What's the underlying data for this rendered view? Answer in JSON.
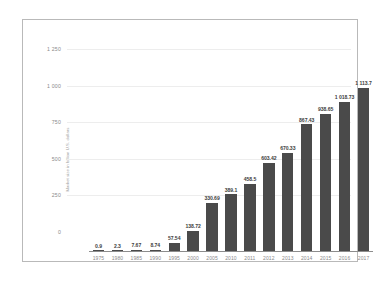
{
  "chart_data": {
    "type": "bar",
    "title": "",
    "subtitle": "",
    "xlabel": "",
    "ylabel": "Market size in billion U.S. dollars",
    "categories": [
      "1975",
      "1980",
      "1985",
      "1990",
      "1995",
      "2000",
      "2005",
      "2010",
      "2011",
      "2012",
      "2013",
      "2014",
      "2015",
      "2016",
      "2017"
    ],
    "values": [
      0.9,
      2.3,
      7.67,
      8.74,
      57.54,
      138.72,
      330.69,
      389.1,
      458.5,
      603.42,
      670.33,
      867.43,
      938.65,
      1018.73,
      1113.7
    ],
    "value_labels": [
      "0.9",
      "2.3",
      "7.67",
      "8.74",
      "57.54",
      "138.72",
      "330.69",
      "389.1",
      "458.5",
      "603.42",
      "670.33",
      "867.43",
      "938.65",
      "1 018.73",
      "1 113.7"
    ],
    "ylim": [
      0,
      1250
    ],
    "y_ticks": [
      0,
      250,
      500,
      750,
      1000,
      1250
    ],
    "y_tick_labels": [
      "0",
      "250",
      "500",
      "750",
      "1 000",
      "1 250"
    ],
    "grid": true,
    "grid_axis": "y",
    "legend": false,
    "legend_position": "none",
    "series": [
      {
        "name": "Market size",
        "values": [
          0.9,
          2.3,
          7.67,
          8.74,
          57.54,
          138.72,
          330.69,
          389.1,
          458.5,
          603.42,
          670.33,
          867.43,
          938.65,
          1018.73,
          1113.7
        ]
      }
    ]
  },
  "style": {
    "bar_color": "#4a4a4a",
    "grid_color": "#ededed",
    "axis_color": "#8d8d8d",
    "tick_label_color": "#8a8a8a",
    "value_label_color": "#3d3d3d",
    "frame_color": "#b9b9b9",
    "background": "#ffffff"
  }
}
